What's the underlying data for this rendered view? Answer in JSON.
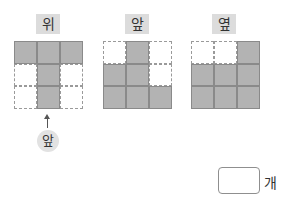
{
  "views": [
    {
      "label": "위",
      "cells": [
        [
          1,
          1,
          1
        ],
        [
          0,
          1,
          0
        ],
        [
          0,
          1,
          0
        ]
      ]
    },
    {
      "label": "앞",
      "cells": [
        [
          0,
          1,
          0
        ],
        [
          1,
          1,
          0
        ],
        [
          1,
          1,
          1
        ]
      ]
    },
    {
      "label": "옆",
      "cells": [
        [
          0,
          0,
          1
        ],
        [
          1,
          1,
          1
        ],
        [
          1,
          1,
          1
        ]
      ]
    }
  ],
  "front_marker": {
    "label": "앞",
    "icon": "arrow-up-icon"
  },
  "answer": {
    "value": "",
    "unit": "개"
  },
  "colors": {
    "filled": "#b3b3b3",
    "label_bg": "#dcdcdc",
    "border": "#8a8a8a"
  }
}
